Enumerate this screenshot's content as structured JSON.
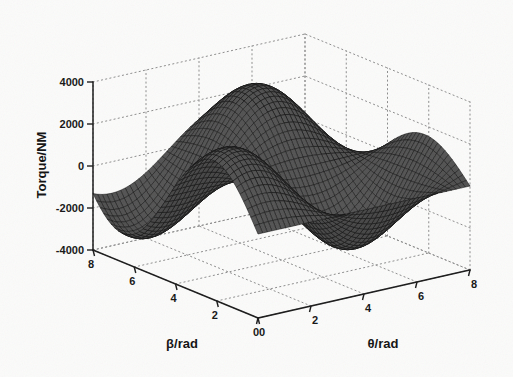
{
  "figure": {
    "background_color": "#fbfbfa",
    "type": "matlab-3d-surface-mesh",
    "mesh_color": "#2b2b2b",
    "grid_color": "#8a8a8a",
    "axis_color": "#1a1a1a"
  },
  "chart_data": {
    "type": "surface",
    "title": "",
    "xlabel": "β/rad",
    "ylabel": "θ/rad",
    "zlabel": "Torque/NM",
    "xlim": [
      0,
      8
    ],
    "ylim": [
      0,
      8
    ],
    "zlim": [
      -4000,
      4000
    ],
    "xticks": [
      0,
      2,
      4,
      6,
      8
    ],
    "yticks": [
      0,
      2,
      4,
      6,
      8
    ],
    "zticks": [
      -4000,
      -2000,
      0,
      2000,
      4000
    ],
    "xtick_labels": [
      "0",
      "2",
      "4",
      "6",
      "8"
    ],
    "ytick_labels": [
      "0",
      "2",
      "4",
      "6",
      "8"
    ],
    "ztick_labels": [
      "-4000",
      "-2000",
      "0",
      "2000",
      "4000"
    ],
    "grid": true,
    "legend": false,
    "colormap": "gray-mesh",
    "surface_formula": "z = 3000 * sin(beta*0.72) * cos(theta*0.72 - 0.5)",
    "amplitude": 3000,
    "peak_value": 3000,
    "trough_value": -3200,
    "view_azimuth": -37.5,
    "view_elevation": 30,
    "mesh_density_x": 60,
    "mesh_density_y": 60
  },
  "labels": {
    "z_axis_title": "Torque/NM",
    "x_axis_title": "β/rad",
    "y_axis_title": "θ/rad",
    "z_ticks": [
      "4000",
      "2000",
      "0",
      "-2000",
      "-4000"
    ],
    "beta_ticks": [
      "8",
      "6",
      "4",
      "2",
      "0"
    ],
    "theta_ticks": [
      "0",
      "2",
      "4",
      "6",
      "8"
    ]
  }
}
